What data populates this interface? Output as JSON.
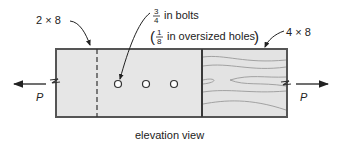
{
  "diagram": {
    "title": "elevation view",
    "labels": {
      "left_member": "2 × 8",
      "right_member": "4 × 8",
      "bolt_fraction_num": "3",
      "bolt_fraction_den": "4",
      "bolt_text": "in bolts",
      "hole_fraction_num": "1",
      "hole_fraction_den": "8",
      "hole_text": "in oversized holes",
      "load_left": "P",
      "load_right": "P"
    },
    "colors": {
      "wood_fill": "#e6e6e6",
      "outline": "#555555",
      "grain": "#9a9a9a",
      "text": "#222222"
    },
    "bolts": {
      "count": 3
    }
  }
}
